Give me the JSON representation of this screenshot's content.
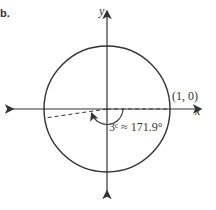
{
  "figure": {
    "part_label": "b.",
    "axes": {
      "x_label": "x",
      "y_label": "y"
    },
    "point_label": "(1, 0)",
    "angle_label": "3ᶜ ≈ 171.9°",
    "angle_radians": 3,
    "angle_degrees": 171.9,
    "colors": {
      "stroke": "#333333",
      "background": "#ffffff"
    }
  }
}
